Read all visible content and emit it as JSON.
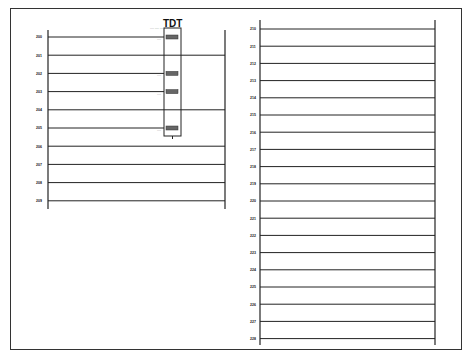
{
  "diagram": {
    "type": "ladder-logic",
    "left_panel": {
      "rungs": [
        {
          "label": "200",
          "connects_to_block": true
        },
        {
          "label": "201",
          "connects_to_block": false
        },
        {
          "label": "202",
          "connects_to_block": true
        },
        {
          "label": "203",
          "connects_to_block": true
        },
        {
          "label": "204",
          "connects_to_block": false
        },
        {
          "label": "205",
          "connects_to_block": true
        },
        {
          "label": "206",
          "connects_to_block": false
        },
        {
          "label": "207",
          "connects_to_block": false
        },
        {
          "label": "208",
          "connects_to_block": false
        },
        {
          "label": "209",
          "connects_to_block": false
        }
      ],
      "block": {
        "title": "TDT",
        "header_text": "---- ---- ----",
        "pins": [
          "----",
          "----",
          "----",
          "----"
        ]
      }
    },
    "right_panel": {
      "rungs": [
        "210",
        "211",
        "212",
        "213",
        "214",
        "215",
        "216",
        "217",
        "218",
        "219",
        "220",
        "221",
        "222",
        "223",
        "224",
        "225",
        "226",
        "227",
        "228"
      ]
    }
  }
}
